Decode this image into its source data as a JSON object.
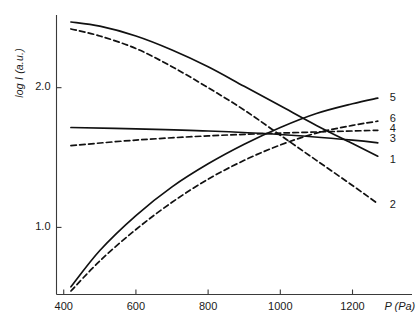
{
  "chart_data": {
    "type": "line",
    "title": "",
    "xlabel": "P (Pa)",
    "ylabel": "log I (a.u.)",
    "xlim": [
      380,
      1290
    ],
    "ylim": [
      0.52,
      2.52
    ],
    "grid": false,
    "legend_position": "right-edge-labels",
    "xticks": [
      400,
      600,
      800,
      1000,
      1200
    ],
    "xtick_labels": [
      "400",
      "600",
      "800",
      "1000",
      "1200"
    ],
    "yticks": [
      1.0,
      2.0
    ],
    "ytick_labels": [
      "1.0",
      "2.0"
    ],
    "series": [
      {
        "name": "1",
        "label": "1",
        "style": "solid",
        "color": "#111111",
        "x": [
          420,
          500,
          600,
          700,
          800,
          900,
          1000,
          1100,
          1200,
          1270
        ],
        "y": [
          2.47,
          2.44,
          2.37,
          2.27,
          2.15,
          2.01,
          1.87,
          1.73,
          1.6,
          1.51
        ]
      },
      {
        "name": "2",
        "label": "2",
        "style": "dashed",
        "color": "#111111",
        "x": [
          420,
          500,
          600,
          700,
          800,
          900,
          1000,
          1100,
          1200,
          1270
        ],
        "y": [
          2.42,
          2.37,
          2.28,
          2.15,
          2.0,
          1.84,
          1.66,
          1.48,
          1.3,
          1.17
        ]
      },
      {
        "name": "3",
        "label": "3",
        "style": "solid",
        "color": "#111111",
        "x": [
          420,
          600,
          800,
          1000,
          1200,
          1270
        ],
        "y": [
          1.715,
          1.705,
          1.69,
          1.665,
          1.625,
          1.605
        ]
      },
      {
        "name": "4",
        "label": "4",
        "style": "dashed",
        "color": "#111111",
        "x": [
          420,
          600,
          800,
          1000,
          1200,
          1270
        ],
        "y": [
          1.585,
          1.625,
          1.655,
          1.675,
          1.69,
          1.695
        ]
      },
      {
        "name": "5",
        "label": "5",
        "style": "solid",
        "color": "#111111",
        "x": [
          420,
          500,
          600,
          700,
          800,
          900,
          1000,
          1100,
          1200,
          1270
        ],
        "y": [
          0.575,
          0.835,
          1.085,
          1.29,
          1.455,
          1.595,
          1.715,
          1.815,
          1.885,
          1.925
        ]
      },
      {
        "name": "6",
        "label": "6",
        "style": "dashed",
        "color": "#111111",
        "x": [
          420,
          500,
          600,
          700,
          800,
          900,
          1000,
          1100,
          1200,
          1270
        ],
        "y": [
          0.545,
          0.76,
          0.985,
          1.18,
          1.345,
          1.48,
          1.59,
          1.675,
          1.73,
          1.76
        ]
      }
    ]
  },
  "axis": {
    "x_title": "P (Pa)",
    "y_title": "log I (a.u.)"
  }
}
